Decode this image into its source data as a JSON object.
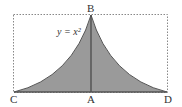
{
  "labels": {
    "B": "B",
    "C": "C",
    "A": "A",
    "D": "D",
    "equation": "y = x²"
  },
  "colors": {
    "fill": "#9a9a9a",
    "stroke": "#555555",
    "dotted": "#888888"
  }
}
